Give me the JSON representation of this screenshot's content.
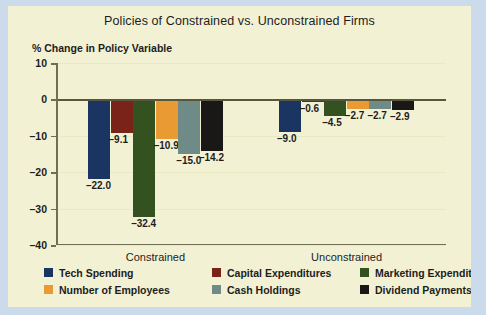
{
  "chart_data": {
    "type": "bar",
    "title": "Policies of Constrained  vs. Unconstrained Firms",
    "ylabel": "% Change in Policy Variable",
    "xlabel": "",
    "ylim": [
      -40,
      10
    ],
    "yticks": [
      10,
      0,
      -10,
      -20,
      -30,
      -40
    ],
    "ytick_labels": [
      "10",
      "0",
      "–10",
      "–20",
      "–30",
      "–40"
    ],
    "grid": true,
    "legend_position": "bottom",
    "categories": [
      "Constrained",
      "Unconstrained"
    ],
    "series": [
      {
        "name": "Tech Spending",
        "color": "#1b3563",
        "values": [
          -22.0,
          -9.0
        ],
        "labels": [
          "–22.0",
          "–9.0"
        ]
      },
      {
        "name": "Capital Expenditures",
        "color": "#7a2318",
        "values": [
          -9.1,
          -0.6
        ],
        "labels": [
          "–9.1",
          "–0.6"
        ]
      },
      {
        "name": "Marketing Expenditures",
        "color": "#33521f",
        "values": [
          -32.4,
          -4.5
        ],
        "labels": [
          "–32.4",
          "–4.5"
        ]
      },
      {
        "name": "Number of Employees",
        "color": "#e99a33",
        "values": [
          -10.9,
          -2.7
        ],
        "labels": [
          "–10.9",
          "–2.7"
        ]
      },
      {
        "name": "Cash Holdings",
        "color": "#6f8b87",
        "values": [
          -15.0,
          -2.7
        ],
        "labels": [
          "–15.0",
          "–2.7"
        ]
      },
      {
        "name": "Dividend Payments",
        "color": "#191817",
        "values": [
          -14.2,
          -2.9
        ],
        "labels": [
          "–14.2",
          "–2.9"
        ]
      }
    ]
  },
  "colors": {
    "figure_background": "#f2f1d4",
    "page_background": "#ccdbeb",
    "axis": "#6f6f54",
    "gridline": "#e9e9c6",
    "text": "#1d1d1d"
  }
}
